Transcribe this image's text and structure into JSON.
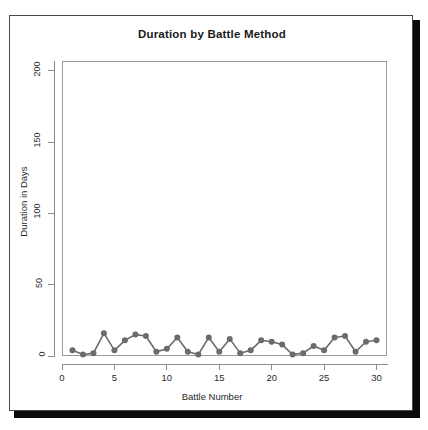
{
  "clipped_header_text": "",
  "chart_data": {
    "type": "line",
    "title": "Duration by Battle Method",
    "xlabel": "Battle Number",
    "ylabel": "Duration in Days",
    "xlim": [
      0,
      31
    ],
    "ylim": [
      0,
      207
    ],
    "grid": false,
    "legend": null,
    "marker": "filled-circle",
    "line_color": "#6b6b6b",
    "marker_color": "#6b6b6b",
    "panel_border_color": "#9a9a9a",
    "x_ticks": [
      0,
      5,
      10,
      15,
      20,
      25,
      30
    ],
    "y_ticks": [
      0,
      50,
      100,
      150,
      200
    ],
    "x": [
      1,
      2,
      3,
      4,
      5,
      6,
      7,
      8,
      9,
      10,
      11,
      12,
      13,
      14,
      15,
      16,
      17,
      18,
      19,
      20,
      21,
      22,
      23,
      24,
      25,
      26,
      27,
      28,
      29,
      30
    ],
    "values": [
      4,
      1,
      2,
      16,
      4,
      11,
      15,
      14,
      3,
      5,
      13,
      3,
      1,
      13,
      3,
      12,
      2,
      4,
      11,
      10,
      8,
      1,
      2,
      7,
      4,
      13,
      14,
      3,
      10,
      11
    ],
    "series": [
      {
        "name": "Duration in Days",
        "values": [
          4,
          1,
          2,
          16,
          4,
          11,
          15,
          14,
          3,
          5,
          13,
          3,
          1,
          13,
          3,
          12,
          2,
          4,
          11,
          10,
          8,
          1,
          2,
          7,
          4,
          13,
          14,
          3,
          10,
          11
        ]
      }
    ]
  }
}
